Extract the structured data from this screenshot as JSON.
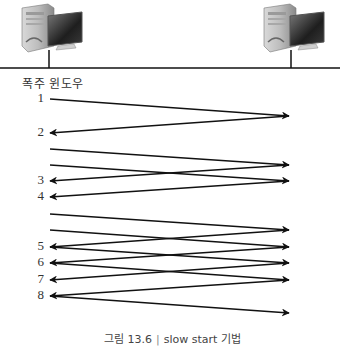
{
  "diagram": {
    "title_label": "폭주 윈도우",
    "hosts": [
      {
        "name": "sender",
        "icon": "desktop-computer-icon"
      },
      {
        "name": "receiver",
        "icon": "desktop-computer-icon"
      }
    ],
    "window_numbers": [
      "1",
      "2",
      "3",
      "4",
      "5",
      "6",
      "7",
      "8"
    ],
    "segments": [
      {
        "direction": "send",
        "from_slot": 0,
        "to_slot": 1
      },
      {
        "direction": "ack",
        "from_slot": 1,
        "to_slot": 2,
        "label_index": 1
      },
      {
        "direction": "send",
        "from_slot": 3,
        "to_slot": 4
      },
      {
        "direction": "send",
        "from_slot": 4,
        "to_slot": 5
      },
      {
        "direction": "ack",
        "from_slot": 4,
        "to_slot": 5,
        "label_index": 2
      },
      {
        "direction": "ack",
        "from_slot": 5,
        "to_slot": 6,
        "label_index": 3
      },
      {
        "direction": "send",
        "from_slot": 7,
        "to_slot": 8
      },
      {
        "direction": "send",
        "from_slot": 8,
        "to_slot": 9
      },
      {
        "direction": "ack",
        "from_slot": 8,
        "to_slot": 9,
        "label_index": 4
      },
      {
        "direction": "send",
        "from_slot": 9,
        "to_slot": 10
      },
      {
        "direction": "ack",
        "from_slot": 9,
        "to_slot": 10,
        "label_index": 5
      },
      {
        "direction": "send",
        "from_slot": 10,
        "to_slot": 11
      },
      {
        "direction": "ack",
        "from_slot": 10,
        "to_slot": 11,
        "label_index": 6
      },
      {
        "direction": "ack",
        "from_slot": 11,
        "to_slot": 12,
        "label_index": 7
      },
      {
        "direction": "send",
        "from_slot": 12,
        "to_slot": 13
      }
    ],
    "number_slots": [
      0,
      2,
      5,
      6,
      9,
      10,
      11,
      12
    ]
  },
  "caption": {
    "figure": "그림 13.6",
    "separator": "|",
    "text": "slow start 기법"
  }
}
